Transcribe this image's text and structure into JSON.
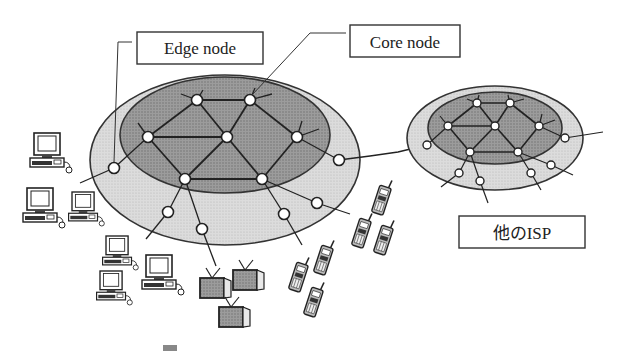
{
  "labels": {
    "edge_node": "Edge node",
    "core_node": "Core node",
    "other_isp": "他のISP"
  },
  "colors": {
    "background": "#ffffff",
    "outer_ring": "#d8d8d8",
    "core_area": "#9a9a9a",
    "stroke": "#333333",
    "node_fill": "#ffffff",
    "tv_screen": "#a8a8a8"
  },
  "diagram": {
    "networks": [
      {
        "name": "main-isp",
        "core_nodes": 8,
        "edge_nodes": 7
      },
      {
        "name": "other-isp",
        "core_nodes": 7,
        "edge_nodes": 6
      }
    ],
    "devices": {
      "computers": 7,
      "televisions": 3,
      "mobile_phones": 6
    }
  }
}
